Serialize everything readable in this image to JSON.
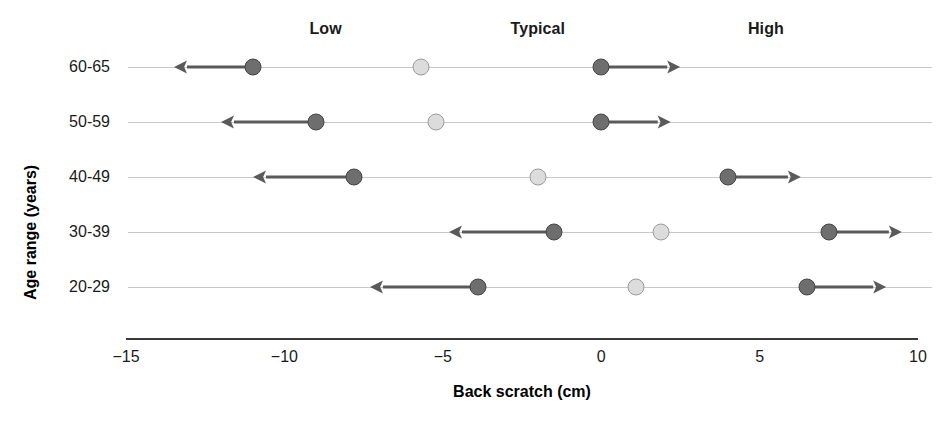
{
  "chart_data": {
    "type": "scatter",
    "title": "",
    "xlabel": "Back scratch (cm)",
    "ylabel": "Age range (years)",
    "xlim": [
      -15,
      10
    ],
    "xticks": [
      -15,
      -10,
      -5,
      0,
      5,
      10
    ],
    "xtick_labels": [
      "−15",
      "−10",
      "−5",
      "0",
      "5",
      "10"
    ],
    "categories": [
      "60-65",
      "50-59",
      "40-49",
      "30-39",
      "20-29"
    ],
    "grid": true,
    "legend_position": "top",
    "column_headers": [
      {
        "label": "Low",
        "x": -8.7
      },
      {
        "label": "Typical",
        "x": -2.0
      },
      {
        "label": "High",
        "x": 5.2
      }
    ],
    "series": [
      {
        "name": "Low",
        "marker": "dark-circle",
        "color": "#6e6e6e",
        "edge_color": "#444444",
        "arrow_direction": "left",
        "values": [
          -11.0,
          -9.0,
          -7.8,
          -1.5,
          -3.9
        ],
        "arrow_tips": [
          -13.5,
          -12.0,
          -11.0,
          -4.8,
          -7.3
        ]
      },
      {
        "name": "Typical",
        "marker": "light-circle",
        "color": "#dcdcdc",
        "edge_color": "#9a9a9a",
        "arrow_direction": "none",
        "values": [
          -5.7,
          -5.2,
          -2.0,
          1.9,
          1.1
        ],
        "arrow_tips": [
          null,
          null,
          null,
          null,
          null
        ]
      },
      {
        "name": "High",
        "marker": "dark-circle",
        "color": "#6e6e6e",
        "edge_color": "#444444",
        "arrow_direction": "right",
        "values": [
          0.0,
          0.0,
          4.0,
          7.2,
          6.5
        ],
        "arrow_tips": [
          2.5,
          2.2,
          6.3,
          9.5,
          9.0
        ]
      }
    ]
  },
  "axes": {
    "y_title": "Age range (years)",
    "x_title": "Back scratch (cm)"
  }
}
